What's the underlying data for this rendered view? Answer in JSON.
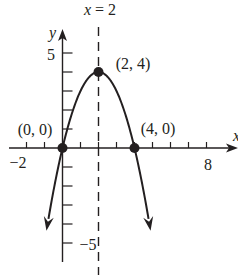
{
  "diagram": {
    "title_label": "x = 2",
    "axes": {
      "x_label": "x",
      "y_label": "y",
      "x_range": [
        -2.9,
        9.7
      ],
      "y_range": [
        -6.8,
        6.1
      ],
      "x_ticks": [
        -2,
        -1,
        1,
        2,
        3,
        4,
        5,
        6,
        7,
        8
      ],
      "y_ticks": [
        -5,
        -4,
        -3,
        -2,
        -1,
        1,
        2,
        3,
        4,
        5
      ],
      "x_tick_labels": {
        "neg": "−2",
        "pos": "8"
      },
      "y_tick_labels": {
        "pos": "5",
        "neg": "−5"
      }
    },
    "curve": {
      "equation": "y = -x^2 + 4x",
      "type": "parabola",
      "opens": "down",
      "axis_of_symmetry": 2
    },
    "points": [
      {
        "label": "(0, 0)",
        "x": 0,
        "y": 0
      },
      {
        "label": "(2, 4)",
        "x": 2,
        "y": 4
      },
      {
        "label": "(4, 0)",
        "x": 4,
        "y": 0
      }
    ],
    "colors": {
      "ink": "#231f20",
      "background": "#ffffff"
    }
  }
}
